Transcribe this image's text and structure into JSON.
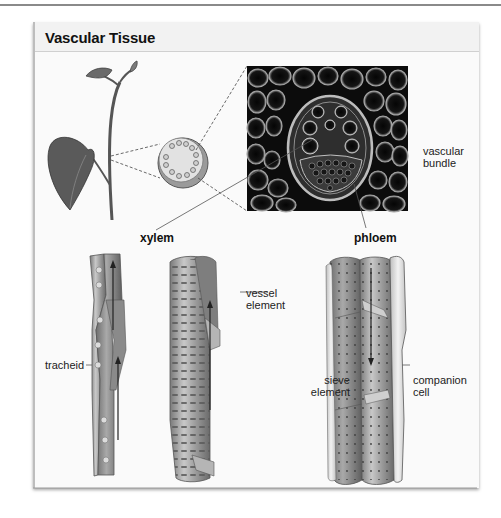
{
  "figure": {
    "title": "Vascular Tissue",
    "labels": {
      "vascular_bundle_line1": "vascular",
      "vascular_bundle_line2": "bundle",
      "xylem": "xylem",
      "phloem": "phloem",
      "tracheid": "tracheid",
      "vessel_element_line1": "vessel",
      "vessel_element_line2": "element",
      "sieve_element_line1": "sieve",
      "sieve_element_line2": "element",
      "companion_cell_line1": "companion",
      "companion_cell_line2": "cell"
    },
    "panels": [
      {
        "id": "plant-illustration",
        "description": "plant stem with leaves"
      },
      {
        "id": "stem-cross-section",
        "description": "circular stem cross-section with ring of vascular bundles"
      },
      {
        "id": "micrograph",
        "description": "micrograph of a vascular bundle"
      },
      {
        "id": "tracheid-illustration",
        "description": "tracheid cells with upward arrows"
      },
      {
        "id": "vessel-element-illustration",
        "description": "vessel element with upward arrow"
      },
      {
        "id": "phloem-illustration",
        "description": "sieve elements with companion cells and downward arrow"
      }
    ],
    "colors": {
      "title_band": "#f2f2f2",
      "panel_bg": "#fafafa",
      "micrograph_bg": "#0c0c0c",
      "cell_fill": "#8c8c8c",
      "leaf_fill": "#5a5a5a"
    }
  }
}
